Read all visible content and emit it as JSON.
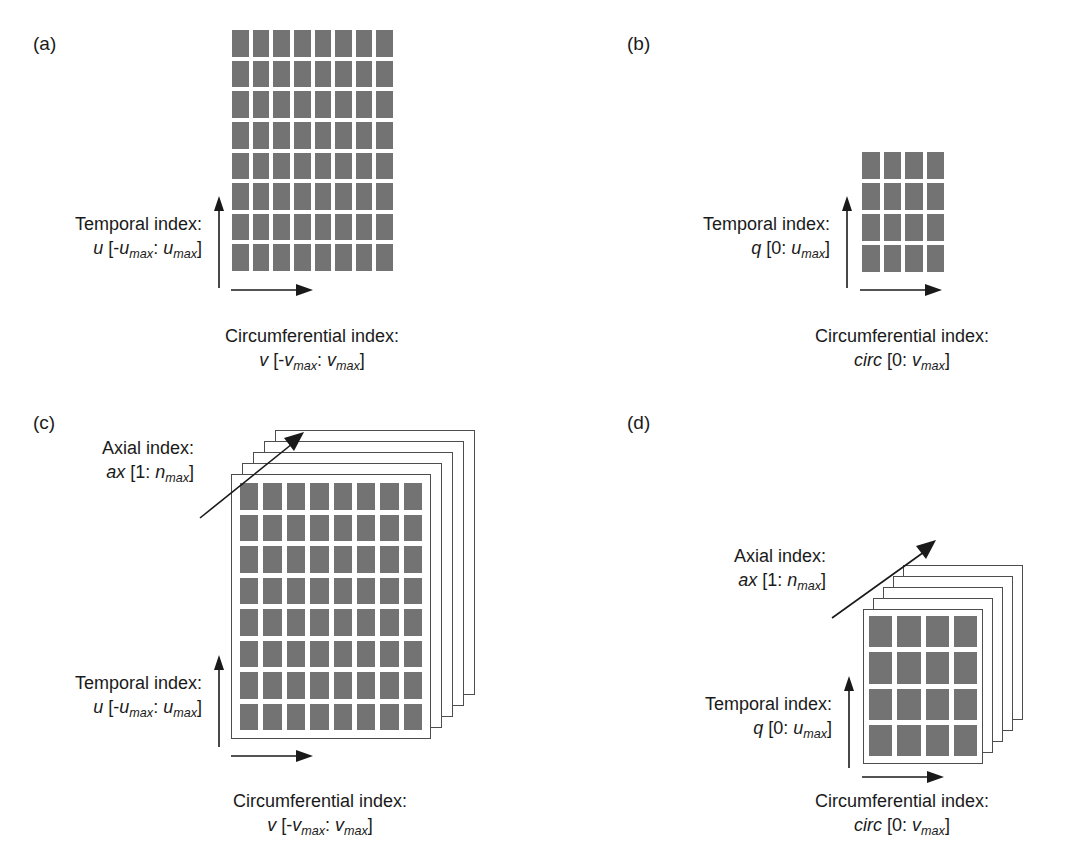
{
  "figure": {
    "background": "#ffffff",
    "cell_color": "#737373",
    "line_color": "#1a1a1a",
    "sheet_border_color": "#4d4d4d"
  },
  "panels": [
    {
      "id": "a",
      "letter": "(a)",
      "grid": {
        "rows": 8,
        "cols": 8
      },
      "stack_layers": 0,
      "vertical_axis": {
        "title": "Temporal index:",
        "symbol": "u",
        "range_open": "[-",
        "range_lo_base": "u",
        "range_lo_sub": "max",
        "range_sep": ": ",
        "range_hi_base": "u",
        "range_hi_sub": "max",
        "range_close": "]"
      },
      "horizontal_axis": {
        "title": "Circumferential index:",
        "symbol": "v",
        "range_open": "[-",
        "range_lo_base": "v",
        "range_lo_sub": "max",
        "range_sep": ": ",
        "range_hi_base": "v",
        "range_hi_sub": "max",
        "range_close": "]"
      },
      "axial_axis": null
    },
    {
      "id": "b",
      "letter": "(b)",
      "grid": {
        "rows": 4,
        "cols": 4
      },
      "stack_layers": 0,
      "vertical_axis": {
        "title": "Temporal index:",
        "symbol": "q",
        "range_open": "[0: ",
        "range_lo_base": "",
        "range_lo_sub": "",
        "range_sep": "",
        "range_hi_base": "u",
        "range_hi_sub": "max",
        "range_close": "]"
      },
      "horizontal_axis": {
        "title": "Circumferential index:",
        "symbol": "circ",
        "range_open": "[0: ",
        "range_lo_base": "",
        "range_lo_sub": "",
        "range_sep": "",
        "range_hi_base": "v",
        "range_hi_sub": "max",
        "range_close": "]"
      },
      "axial_axis": null
    },
    {
      "id": "c",
      "letter": "(c)",
      "grid": {
        "rows": 8,
        "cols": 8
      },
      "stack_layers": 5,
      "vertical_axis": {
        "title": "Temporal index:",
        "symbol": "u",
        "range_open": "[-",
        "range_lo_base": "u",
        "range_lo_sub": "max",
        "range_sep": ": ",
        "range_hi_base": "u",
        "range_hi_sub": "max",
        "range_close": "]"
      },
      "horizontal_axis": {
        "title": "Circumferential index:",
        "symbol": "v",
        "range_open": "[-",
        "range_lo_base": "v",
        "range_lo_sub": "max",
        "range_sep": ": ",
        "range_hi_base": "v",
        "range_hi_sub": "max",
        "range_close": "]"
      },
      "axial_axis": {
        "title": "Axial index:",
        "symbol": "ax",
        "range_open": "[1: ",
        "range_hi_base": "n",
        "range_hi_sub": "max",
        "range_close": "]"
      }
    },
    {
      "id": "d",
      "letter": "(d)",
      "grid": {
        "rows": 4,
        "cols": 4
      },
      "stack_layers": 5,
      "vertical_axis": {
        "title": "Temporal index:",
        "symbol": "q",
        "range_open": "[0: ",
        "range_lo_base": "",
        "range_lo_sub": "",
        "range_sep": "",
        "range_hi_base": "u",
        "range_hi_sub": "max",
        "range_close": "]"
      },
      "horizontal_axis": {
        "title": "Circumferential index:",
        "symbol": "circ",
        "range_open": "[0: ",
        "range_lo_base": "",
        "range_lo_sub": "",
        "range_sep": "",
        "range_hi_base": "v",
        "range_hi_sub": "max",
        "range_close": "]"
      },
      "axial_axis": {
        "title": "Axial index:",
        "symbol": "ax",
        "range_open": "[1: ",
        "range_hi_base": "n",
        "range_hi_sub": "max",
        "range_close": "]"
      }
    }
  ]
}
